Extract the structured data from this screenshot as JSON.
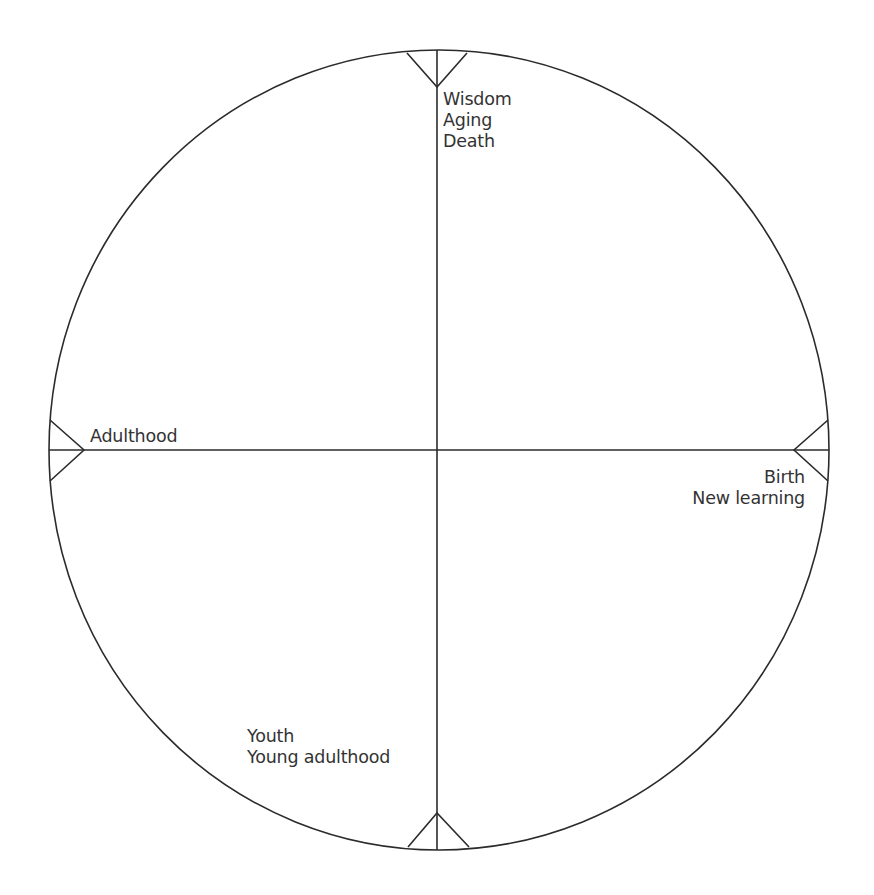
{
  "diagram": {
    "type": "life-cycle-wheel",
    "stroke_color": "#2b2b2b",
    "text_color": "#333333",
    "circle": {
      "cx": 439,
      "cy": 450,
      "rx": 390,
      "ry": 400
    },
    "quadrant_points": {
      "top": {
        "position": "north",
        "lines": [
          "Wisdom",
          "Aging",
          "Death"
        ]
      },
      "left": {
        "position": "west",
        "lines": [
          "Adulthood"
        ]
      },
      "right": {
        "position": "east",
        "lines": [
          "Birth",
          "New learning"
        ]
      },
      "bottom": {
        "position": "south",
        "lines": [
          "Youth",
          "Young adulthood"
        ]
      }
    }
  }
}
